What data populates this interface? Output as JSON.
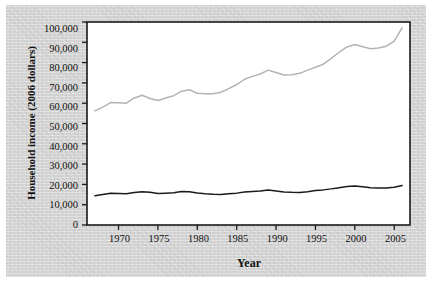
{
  "chart_data": {
    "type": "line",
    "title": "",
    "xlabel": "Year",
    "ylabel": "Household income (2006 dollars)",
    "xlim": [
      1966,
      2007
    ],
    "ylim": [
      0,
      100000
    ],
    "grid": false,
    "legend_position": "inline-annotations",
    "xticks": [
      "1970",
      "1975",
      "1980",
      "1985",
      "1990",
      "1995",
      "2000",
      "2005"
    ],
    "xtick_values": [
      1970,
      1975,
      1980,
      1985,
      1990,
      1995,
      2000,
      2005
    ],
    "yticks": [
      "0",
      "10,000",
      "20,000",
      "30,000",
      "40,000",
      "50,000",
      "60,000",
      "70,000",
      "80,000",
      "90,000",
      "100,000"
    ],
    "ytick_values": [
      0,
      10000,
      20000,
      30000,
      40000,
      50000,
      60000,
      70000,
      80000,
      90000,
      100000
    ],
    "x": [
      1967,
      1968,
      1969,
      1970,
      1971,
      1972,
      1973,
      1974,
      1975,
      1976,
      1977,
      1978,
      1979,
      1980,
      1981,
      1982,
      1983,
      1984,
      1985,
      1986,
      1987,
      1988,
      1989,
      1990,
      1991,
      1992,
      1993,
      1994,
      1995,
      1996,
      1997,
      1998,
      1999,
      2000,
      2001,
      2002,
      2003,
      2004,
      2005,
      2006
    ],
    "series": [
      {
        "name": "80th percentile",
        "color": "#b3b3b3",
        "label_text": "80th percentile",
        "values": [
          56200,
          58100,
          60300,
          60200,
          60000,
          62600,
          63900,
          62300,
          61300,
          62600,
          63700,
          65900,
          66600,
          64900,
          64600,
          64700,
          65400,
          67200,
          69200,
          71800,
          73200,
          74400,
          76300,
          75100,
          73900,
          74000,
          74700,
          76300,
          77700,
          79200,
          82100,
          85100,
          87700,
          88900,
          87800,
          86800,
          87200,
          88100,
          90600,
          97100
        ]
      },
      {
        "name": "20th percentile",
        "color": "#1a1a1a",
        "label_text": "20th percentile",
        "values": [
          14400,
          15000,
          15600,
          15500,
          15400,
          16000,
          16400,
          16100,
          15500,
          15700,
          15900,
          16500,
          16400,
          15800,
          15400,
          15100,
          15000,
          15400,
          15700,
          16200,
          16500,
          16800,
          17200,
          16800,
          16300,
          16100,
          16000,
          16400,
          17000,
          17300,
          17800,
          18400,
          19000,
          19200,
          18800,
          18400,
          18200,
          18200,
          18600,
          19500
        ]
      }
    ],
    "annotations": [
      {
        "text": "80th percentile",
        "x": 1980.5,
        "y": 82000
      },
      {
        "text": "20th percentile",
        "x": 1981.0,
        "y": 27500
      }
    ]
  }
}
